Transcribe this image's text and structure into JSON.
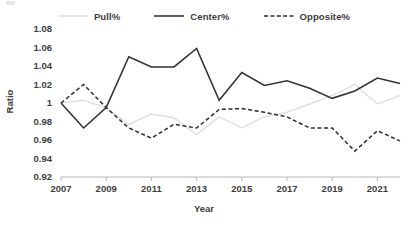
{
  "chart_data": {
    "type": "line",
    "title": "",
    "xlabel": "Year",
    "ylabel": "Ratio",
    "x": [
      2007,
      2008,
      2009,
      2010,
      2011,
      2012,
      2013,
      2014,
      2015,
      2016,
      2017,
      2018,
      2019,
      2020,
      2021,
      2022
    ],
    "xtick_labels": [
      "2007",
      "2009",
      "2011",
      "2013",
      "2015",
      "2017",
      "2019",
      "2021"
    ],
    "xtick_values": [
      2007,
      2009,
      2011,
      2013,
      2015,
      2017,
      2019,
      2021
    ],
    "ytick_labels": [
      "1.08",
      "1.06",
      "1.04",
      "1.02",
      "1",
      "0.98",
      "0.96",
      "0.94",
      "0.92"
    ],
    "ytick_values": [
      1.08,
      1.06,
      1.04,
      1.02,
      1.0,
      0.98,
      0.96,
      0.94,
      0.92
    ],
    "ylim": [
      0.92,
      1.08
    ],
    "xlim": [
      2007,
      2022
    ],
    "grid": false,
    "legend_position": "top",
    "series": [
      {
        "name": "Pull%",
        "style": "solid",
        "color": "#e2e2e2",
        "values": [
          1.0,
          1.003,
          0.995,
          0.977,
          0.988,
          0.984,
          0.966,
          0.985,
          0.973,
          0.985,
          0.99,
          0.999,
          1.008,
          1.02,
          0.999,
          1.008
        ]
      },
      {
        "name": "Center%",
        "style": "solid",
        "color": "#333333",
        "values": [
          1.0,
          0.973,
          0.995,
          1.05,
          1.039,
          1.039,
          1.059,
          1.003,
          1.033,
          1.019,
          1.024,
          1.016,
          1.005,
          1.013,
          1.027,
          1.021
        ]
      },
      {
        "name": "Opposite%",
        "style": "dashed",
        "color": "#2b2b2b",
        "values": [
          1.0,
          1.02,
          0.995,
          0.973,
          0.962,
          0.977,
          0.973,
          0.993,
          0.994,
          0.99,
          0.985,
          0.973,
          0.973,
          0.948,
          0.97,
          0.959
        ]
      }
    ]
  },
  "legend": {
    "entries": [
      {
        "label": "Pull%"
      },
      {
        "label": "Center%"
      },
      {
        "label": "Opposite%"
      }
    ]
  },
  "axes": {
    "y_title": "Ratio",
    "x_title": "Year"
  }
}
